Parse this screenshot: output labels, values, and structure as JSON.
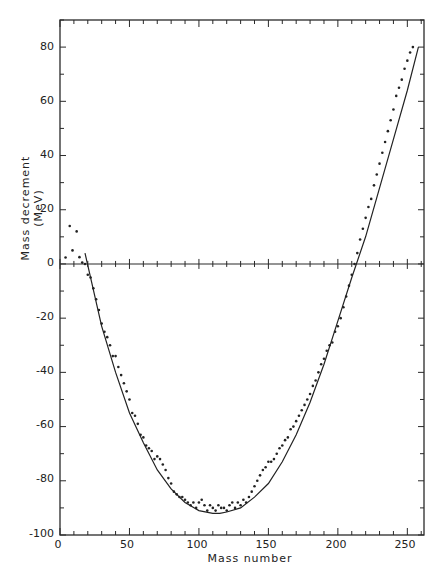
{
  "chart_data": {
    "type": "scatter",
    "title": "",
    "xlabel": "Mass number",
    "ylabel": "Mass decrement (MeV)",
    "xlim": [
      0,
      262
    ],
    "ylim": [
      -100,
      90
    ],
    "xticks": [
      0,
      50,
      100,
      150,
      200,
      250
    ],
    "yticks": [
      80,
      60,
      40,
      20,
      0,
      -20,
      -40,
      -60,
      -80,
      -100
    ],
    "grid": false,
    "legend": null,
    "series": [
      {
        "name": "Measured mass decrement",
        "kind": "points",
        "x": [
          4,
          7,
          9,
          12,
          14,
          16,
          18,
          20,
          22,
          24,
          26,
          28,
          30,
          32,
          34,
          36,
          38,
          40,
          42,
          44,
          46,
          48,
          50,
          52,
          54,
          56,
          58,
          60,
          62,
          64,
          66,
          68,
          70,
          72,
          74,
          76,
          78,
          80,
          82,
          84,
          86,
          88,
          90,
          92,
          94,
          96,
          98,
          100,
          102,
          104,
          106,
          108,
          110,
          112,
          114,
          116,
          118,
          120,
          122,
          124,
          126,
          128,
          130,
          132,
          134,
          136,
          138,
          140,
          142,
          144,
          146,
          148,
          150,
          152,
          154,
          156,
          158,
          160,
          162,
          164,
          166,
          168,
          170,
          172,
          174,
          176,
          178,
          180,
          182,
          184,
          186,
          188,
          190,
          192,
          194,
          196,
          198,
          200,
          202,
          204,
          206,
          208,
          210,
          212,
          214,
          216,
          218,
          220,
          222,
          224,
          226,
          228,
          230,
          232,
          234,
          236,
          238,
          240,
          242,
          244,
          246,
          248,
          250,
          252,
          254
        ],
        "y": [
          2.4,
          14,
          5,
          12,
          2.5,
          0.5,
          0,
          -4,
          -5,
          -9,
          -13,
          -17,
          -22,
          -25,
          -27,
          -30,
          -34,
          -34,
          -38,
          -41,
          -44,
          -47,
          -50,
          -55,
          -56,
          -59,
          -63,
          -64,
          -67,
          -68,
          -69,
          -72,
          -71,
          -72,
          -74,
          -76,
          -79,
          -81,
          -84,
          -85,
          -86,
          -86,
          -87,
          -88,
          -89,
          -88,
          -90,
          -88,
          -87,
          -89,
          -91,
          -89,
          -90,
          -91,
          -89,
          -90,
          -90,
          -91,
          -89,
          -88,
          -90,
          -88,
          -89,
          -87,
          -88,
          -86,
          -84,
          -82,
          -80,
          -78,
          -76,
          -75,
          -73,
          -73,
          -72,
          -70,
          -68,
          -67,
          -65,
          -64,
          -61,
          -60,
          -58,
          -56,
          -54,
          -52,
          -50,
          -48,
          -45,
          -43,
          -40,
          -37,
          -35,
          -32,
          -30,
          -29,
          -25,
          -23,
          -20,
          -16,
          -12,
          -8,
          -4,
          0,
          4,
          9,
          13,
          17,
          21,
          24,
          29,
          33,
          37,
          41,
          45,
          49,
          53,
          57,
          62,
          65,
          68,
          72,
          75,
          78,
          80
        ],
        "marker": "dot",
        "color": "#222222"
      },
      {
        "name": "Semi-empirical fit",
        "kind": "line",
        "x": [
          18,
          30,
          40,
          50,
          60,
          70,
          80,
          90,
          100,
          110,
          115,
          120,
          130,
          140,
          150,
          160,
          170,
          180,
          190,
          200,
          210,
          220,
          230,
          240,
          250,
          258
        ],
        "y": [
          4,
          -23,
          -40,
          -55,
          -66,
          -76,
          -83,
          -88,
          -91,
          -92,
          -92,
          -91.5,
          -90,
          -86,
          -81,
          -73,
          -63,
          -51,
          -37,
          -21,
          -5,
          10,
          28,
          46,
          64,
          80
        ],
        "color": "#222222"
      }
    ],
    "zero_line": {
      "y": 0,
      "ticks_along": true
    },
    "annotations": []
  },
  "axis_labels": {
    "y_ticks": [
      "80",
      "60",
      "40",
      "20",
      "0",
      "-20",
      "-40",
      "-60",
      "-80",
      "-100"
    ],
    "x_ticks": [
      "0",
      "50",
      "100",
      "150",
      "200",
      "250"
    ],
    "x_title": "Mass number",
    "y_title": "Mass decrement   (MeV)"
  }
}
